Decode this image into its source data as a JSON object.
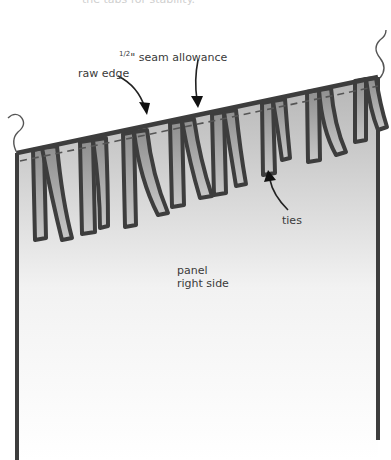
{
  "diagram": {
    "top_caption_partial": "the tabs for stability.",
    "labels": {
      "raw_edge": "raw edge",
      "seam_allowance_fraction": "1/2",
      "seam_allowance": "\" seam allowance",
      "ties": "ties",
      "panel_line1": "panel",
      "panel_line2": "right side"
    },
    "colors": {
      "outline": "#3d3d3d",
      "tie_fill": "#a9a9a9",
      "panel_top": "#b7b7b7",
      "panel_bottom": "#ffffff",
      "text": "#3a3a3a"
    }
  }
}
